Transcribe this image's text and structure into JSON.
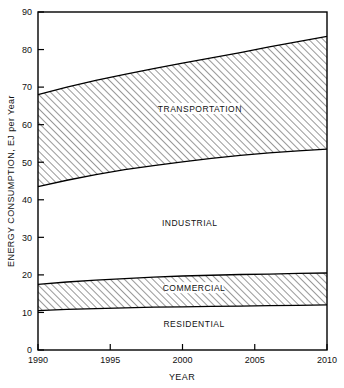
{
  "chart_data": {
    "type": "area",
    "title": "",
    "subtitle": "",
    "xlabel": "YEAR",
    "ylabel": "ENERGY CONSUMPTION, EJ per Year",
    "xlim": [
      1990,
      2010
    ],
    "ylim": [
      0,
      90
    ],
    "x_ticks": [
      1990,
      1995,
      2000,
      2005,
      2010
    ],
    "x_tick_labels": [
      "1990",
      "1995",
      "2000",
      "2005",
      "2010"
    ],
    "x_minor_ticks": [],
    "y_ticks": [
      0,
      10,
      20,
      30,
      40,
      50,
      60,
      70,
      80,
      90
    ],
    "y_tick_labels": [
      "0",
      "10",
      "20",
      "30",
      "40",
      "50",
      "60",
      "70",
      "80",
      "90"
    ],
    "grid": false,
    "legend": "inline-band-labels",
    "stacked": true,
    "x": [
      1990,
      1992,
      1994,
      1996,
      1998,
      2000,
      2002,
      2004,
      2006,
      2008,
      2010
    ],
    "series": [
      {
        "name": "RESIDENTIAL",
        "hatched": false,
        "cumulative_top": [
          10.5,
          10.8,
          11.0,
          11.2,
          11.4,
          11.5,
          11.6,
          11.7,
          11.8,
          11.9,
          12.0
        ],
        "values": [
          10.5,
          10.8,
          11.0,
          11.2,
          11.4,
          11.5,
          11.6,
          11.7,
          11.8,
          11.9,
          12.0
        ]
      },
      {
        "name": "COMMERCIAL",
        "hatched": true,
        "cumulative_top": [
          17.5,
          18.1,
          18.6,
          19.0,
          19.4,
          19.7,
          19.9,
          20.1,
          20.2,
          20.4,
          20.5
        ],
        "values": [
          7.0,
          7.3,
          7.6,
          7.8,
          8.0,
          8.2,
          8.3,
          8.4,
          8.4,
          8.5,
          8.5
        ]
      },
      {
        "name": "INDUSTRIAL",
        "hatched": false,
        "cumulative_top": [
          43.5,
          45.2,
          46.7,
          48.0,
          49.1,
          50.1,
          51.0,
          51.8,
          52.5,
          53.0,
          53.5
        ],
        "values": [
          26.0,
          27.1,
          28.1,
          29.0,
          29.7,
          30.4,
          31.1,
          31.7,
          32.3,
          32.6,
          33.0
        ]
      },
      {
        "name": "TRANSPORTATION",
        "hatched": true,
        "cumulative_top": [
          68.0,
          70.0,
          71.8,
          73.4,
          74.9,
          76.4,
          77.8,
          79.2,
          80.7,
          82.1,
          83.5
        ],
        "values": [
          24.5,
          24.8,
          25.1,
          25.4,
          25.8,
          26.3,
          26.8,
          27.4,
          28.2,
          29.1,
          30.0
        ]
      }
    ],
    "band_labels": [
      {
        "text": "TRANSPORTATION",
        "x": 2001.2,
        "y": 63.5
      },
      {
        "text": "INDUSTRIAL",
        "x": 2000.5,
        "y": 33.0
      },
      {
        "text": "COMMERCIAL",
        "x": 2000.8,
        "y": 15.8
      },
      {
        "text": "RESIDENTIAL",
        "x": 2000.8,
        "y": 6.0
      }
    ],
    "colors": {
      "line": "#000000",
      "hatch": "#333333",
      "background": "#ffffff"
    }
  }
}
